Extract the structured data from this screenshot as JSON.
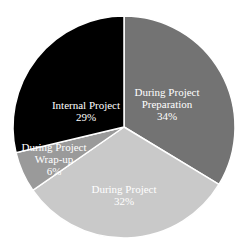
{
  "chart_data": {
    "type": "pie",
    "title": "",
    "start_angle_deg": 0,
    "direction": "clockwise",
    "slices": [
      {
        "label": "During Project Preparation",
        "lines": [
          "During Project",
          "Preparation",
          "34%"
        ],
        "value": 34,
        "color": "#737373",
        "label_pos": [
          167,
          104
        ]
      },
      {
        "label": "During Project",
        "lines": [
          "During Project",
          "32%"
        ],
        "value": 32,
        "color": "#c9c9c9",
        "label_pos": [
          124,
          195
        ]
      },
      {
        "label": "During Project Wrap-up",
        "lines": [
          "During Project",
          "Wrap-up",
          "6%"
        ],
        "value": 6,
        "color": "#9a9a9a",
        "label_pos": [
          54,
          159
        ]
      },
      {
        "label": "Internal Project",
        "lines": [
          "Internal Project",
          "29%"
        ],
        "value": 29,
        "color": "#000000",
        "label_pos": [
          86,
          111
        ]
      }
    ],
    "center": [
      124,
      127
    ],
    "radius": 111,
    "separator_color": "#ffffff"
  }
}
